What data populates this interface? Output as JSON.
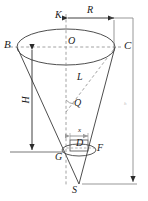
{
  "figure": {
    "type": "geometry-diagram",
    "stroke_color": "#333333",
    "dash_color": "#6e6e6e",
    "background": "#ffffff"
  },
  "labels": {
    "K": "K",
    "R": "R",
    "B": "B",
    "O": "O",
    "C": "C",
    "H": "H",
    "L": "L",
    "Q": "Q",
    "x": "x",
    "D": "D",
    "G": "G",
    "F": "F",
    "S": "S",
    "h": "h"
  },
  "dimensions": {
    "radius_label": "R",
    "height_label": "H",
    "slant_label": "L",
    "angle_label": "Q",
    "small_radius_label": "x",
    "right_height_label": "h"
  },
  "points": {
    "B": {
      "x": 17,
      "y": 47
    },
    "O": {
      "x": 66,
      "y": 47
    },
    "C": {
      "x": 115,
      "y": 47
    },
    "S": {
      "x": 79,
      "y": 184
    },
    "G": {
      "x": 62,
      "y": 152
    },
    "F": {
      "x": 96,
      "y": 148
    },
    "D": {
      "x": 80,
      "y": 148
    }
  }
}
